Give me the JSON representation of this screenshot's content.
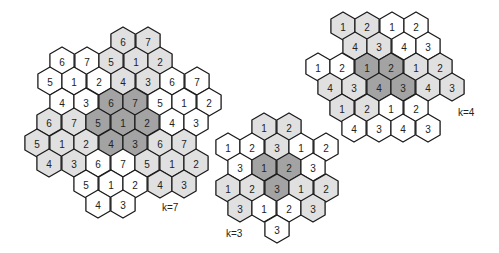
{
  "colors": {
    "white": "#ffffff",
    "light": "#e0e0e0",
    "dark": "#a3a3a3",
    "stroke": "#1a1a1a"
  },
  "hex_radius": 14,
  "clusters": [
    {
      "name": "k=7",
      "label": "k=7",
      "label_pos": [
        162,
        202
      ],
      "cells": [
        {
          "x": 123,
          "y": 41,
          "v": "6",
          "s": "light"
        },
        {
          "x": 148,
          "y": 41,
          "v": "7",
          "s": "light"
        },
        {
          "x": 62,
          "y": 61,
          "v": "6",
          "s": "white"
        },
        {
          "x": 87,
          "y": 61,
          "v": "7",
          "s": "white"
        },
        {
          "x": 111,
          "y": 61,
          "v": "5",
          "s": "light"
        },
        {
          "x": 136,
          "y": 61,
          "v": "1",
          "s": "light"
        },
        {
          "x": 160,
          "y": 61,
          "v": "2",
          "s": "light"
        },
        {
          "x": 50,
          "y": 81,
          "v": "5",
          "s": "white"
        },
        {
          "x": 74,
          "y": 81,
          "v": "1",
          "s": "white"
        },
        {
          "x": 99,
          "y": 81,
          "v": "2",
          "s": "white"
        },
        {
          "x": 123,
          "y": 81,
          "v": "4",
          "s": "light"
        },
        {
          "x": 148,
          "y": 81,
          "v": "3",
          "s": "light"
        },
        {
          "x": 172,
          "y": 81,
          "v": "6",
          "s": "white"
        },
        {
          "x": 197,
          "y": 81,
          "v": "7",
          "s": "white"
        },
        {
          "x": 62,
          "y": 102,
          "v": "4",
          "s": "white"
        },
        {
          "x": 86,
          "y": 102,
          "v": "3",
          "s": "white"
        },
        {
          "x": 111,
          "y": 102,
          "v": "6",
          "s": "dark"
        },
        {
          "x": 135,
          "y": 102,
          "v": "7",
          "s": "dark"
        },
        {
          "x": 160,
          "y": 102,
          "v": "5",
          "s": "white"
        },
        {
          "x": 184,
          "y": 102,
          "v": "1",
          "s": "white"
        },
        {
          "x": 209,
          "y": 102,
          "v": "2",
          "s": "white"
        },
        {
          "x": 49,
          "y": 122,
          "v": "6",
          "s": "light"
        },
        {
          "x": 74,
          "y": 122,
          "v": "7",
          "s": "light"
        },
        {
          "x": 98,
          "y": 122,
          "v": "5",
          "s": "dark"
        },
        {
          "x": 123,
          "y": 122,
          "v": "1",
          "s": "dark"
        },
        {
          "x": 147,
          "y": 122,
          "v": "2",
          "s": "dark"
        },
        {
          "x": 172,
          "y": 122,
          "v": "4",
          "s": "white"
        },
        {
          "x": 196,
          "y": 122,
          "v": "3",
          "s": "white"
        },
        {
          "x": 37,
          "y": 143,
          "v": "5",
          "s": "light"
        },
        {
          "x": 62,
          "y": 143,
          "v": "1",
          "s": "light"
        },
        {
          "x": 86,
          "y": 143,
          "v": "2",
          "s": "light"
        },
        {
          "x": 111,
          "y": 143,
          "v": "4",
          "s": "dark"
        },
        {
          "x": 135,
          "y": 143,
          "v": "3",
          "s": "dark"
        },
        {
          "x": 160,
          "y": 143,
          "v": "6",
          "s": "light"
        },
        {
          "x": 184,
          "y": 143,
          "v": "7",
          "s": "light"
        },
        {
          "x": 49,
          "y": 163,
          "v": "4",
          "s": "light"
        },
        {
          "x": 74,
          "y": 163,
          "v": "3",
          "s": "light"
        },
        {
          "x": 98,
          "y": 163,
          "v": "6",
          "s": "white"
        },
        {
          "x": 123,
          "y": 163,
          "v": "7",
          "s": "white"
        },
        {
          "x": 147,
          "y": 163,
          "v": "5",
          "s": "light"
        },
        {
          "x": 172,
          "y": 163,
          "v": "1",
          "s": "light"
        },
        {
          "x": 196,
          "y": 163,
          "v": "2",
          "s": "light"
        },
        {
          "x": 86,
          "y": 184,
          "v": "5",
          "s": "white"
        },
        {
          "x": 111,
          "y": 184,
          "v": "1",
          "s": "white"
        },
        {
          "x": 135,
          "y": 184,
          "v": "2",
          "s": "white"
        },
        {
          "x": 160,
          "y": 184,
          "v": "4",
          "s": "light"
        },
        {
          "x": 184,
          "y": 184,
          "v": "3",
          "s": "light"
        },
        {
          "x": 98,
          "y": 204,
          "v": "4",
          "s": "white"
        },
        {
          "x": 123,
          "y": 204,
          "v": "3",
          "s": "white"
        }
      ]
    },
    {
      "name": "k=3",
      "label": "k=3",
      "label_pos": [
        226,
        228
      ],
      "cells": [
        {
          "x": 264,
          "y": 127,
          "v": "1",
          "s": "light"
        },
        {
          "x": 289,
          "y": 127,
          "v": "2",
          "s": "light"
        },
        {
          "x": 228,
          "y": 147,
          "v": "1",
          "s": "white"
        },
        {
          "x": 252,
          "y": 147,
          "v": "2",
          "s": "white"
        },
        {
          "x": 277,
          "y": 147,
          "v": "3",
          "s": "light"
        },
        {
          "x": 301,
          "y": 147,
          "v": "1",
          "s": "white"
        },
        {
          "x": 326,
          "y": 147,
          "v": "2",
          "s": "white"
        },
        {
          "x": 240,
          "y": 167,
          "v": "3",
          "s": "white"
        },
        {
          "x": 264,
          "y": 167,
          "v": "1",
          "s": "dark"
        },
        {
          "x": 289,
          "y": 167,
          "v": "2",
          "s": "dark"
        },
        {
          "x": 313,
          "y": 167,
          "v": "3",
          "s": "white"
        },
        {
          "x": 228,
          "y": 188,
          "v": "1",
          "s": "light"
        },
        {
          "x": 252,
          "y": 188,
          "v": "2",
          "s": "light"
        },
        {
          "x": 277,
          "y": 188,
          "v": "3",
          "s": "dark"
        },
        {
          "x": 301,
          "y": 188,
          "v": "1",
          "s": "light"
        },
        {
          "x": 326,
          "y": 188,
          "v": "2",
          "s": "light"
        },
        {
          "x": 240,
          "y": 208,
          "v": "3",
          "s": "light"
        },
        {
          "x": 264,
          "y": 208,
          "v": "1",
          "s": "white"
        },
        {
          "x": 289,
          "y": 208,
          "v": "2",
          "s": "white"
        },
        {
          "x": 313,
          "y": 208,
          "v": "3",
          "s": "light"
        },
        {
          "x": 277,
          "y": 229,
          "v": "3",
          "s": "white"
        }
      ]
    },
    {
      "name": "k=4",
      "label": "k=4",
      "label_pos": [
        458,
        107
      ],
      "cells": [
        {
          "x": 343,
          "y": 26,
          "v": "1",
          "s": "light"
        },
        {
          "x": 367,
          "y": 26,
          "v": "2",
          "s": "light"
        },
        {
          "x": 392,
          "y": 26,
          "v": "1",
          "s": "white"
        },
        {
          "x": 416,
          "y": 26,
          "v": "2",
          "s": "white"
        },
        {
          "x": 355,
          "y": 46,
          "v": "4",
          "s": "light"
        },
        {
          "x": 379,
          "y": 46,
          "v": "3",
          "s": "light"
        },
        {
          "x": 404,
          "y": 46,
          "v": "4",
          "s": "white"
        },
        {
          "x": 428,
          "y": 46,
          "v": "3",
          "s": "white"
        },
        {
          "x": 318,
          "y": 67,
          "v": "1",
          "s": "white"
        },
        {
          "x": 342,
          "y": 67,
          "v": "2",
          "s": "white"
        },
        {
          "x": 367,
          "y": 67,
          "v": "1",
          "s": "dark"
        },
        {
          "x": 391,
          "y": 67,
          "v": "2",
          "s": "dark"
        },
        {
          "x": 416,
          "y": 67,
          "v": "1",
          "s": "light"
        },
        {
          "x": 440,
          "y": 67,
          "v": "2",
          "s": "light"
        },
        {
          "x": 330,
          "y": 87,
          "v": "4",
          "s": "light"
        },
        {
          "x": 354,
          "y": 87,
          "v": "3",
          "s": "light"
        },
        {
          "x": 379,
          "y": 87,
          "v": "4",
          "s": "dark"
        },
        {
          "x": 403,
          "y": 87,
          "v": "3",
          "s": "dark"
        },
        {
          "x": 428,
          "y": 87,
          "v": "4",
          "s": "light"
        },
        {
          "x": 452,
          "y": 87,
          "v": "3",
          "s": "light"
        },
        {
          "x": 342,
          "y": 108,
          "v": "1",
          "s": "light"
        },
        {
          "x": 367,
          "y": 108,
          "v": "2",
          "s": "light"
        },
        {
          "x": 391,
          "y": 108,
          "v": "1",
          "s": "white"
        },
        {
          "x": 416,
          "y": 108,
          "v": "2",
          "s": "white"
        },
        {
          "x": 354,
          "y": 128,
          "v": "4",
          "s": "white"
        },
        {
          "x": 379,
          "y": 128,
          "v": "3",
          "s": "white"
        },
        {
          "x": 403,
          "y": 128,
          "v": "4",
          "s": "white"
        },
        {
          "x": 428,
          "y": 128,
          "v": "3",
          "s": "white"
        }
      ]
    }
  ]
}
